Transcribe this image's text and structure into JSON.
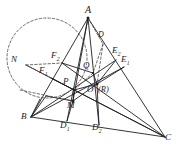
{
  "figure": {
    "type": "geometry-diagram",
    "width": 181,
    "height": 155,
    "background": "#ffffff",
    "stroke_color": "#1f1f1f",
    "dashed_color": "#4a4a4a"
  },
  "points": {
    "A": {
      "label": "A",
      "sub": "",
      "x": 88,
      "y": 18,
      "lx": 85,
      "ly": 7
    },
    "B": {
      "label": "B",
      "sub": "",
      "x": 31,
      "y": 117,
      "lx": 22,
      "ly": 113
    },
    "C": {
      "label": "C",
      "sub": "",
      "x": 165,
      "y": 137,
      "lx": 166,
      "ly": 134
    },
    "N": {
      "label": "N",
      "sub": "",
      "x": 26,
      "y": 65,
      "lx": 12,
      "ly": 56
    },
    "F2": {
      "label": "F",
      "sub": "2",
      "x": 62,
      "y": 63,
      "lx": 52,
      "ly": 52
    },
    "F1": {
      "label": "F",
      "sub": "1",
      "x": 51,
      "y": 78,
      "lx": 40,
      "ly": 67
    },
    "E2": {
      "label": "E",
      "sub": "2",
      "x": 116,
      "y": 60,
      "lx": 113,
      "ly": 47
    },
    "E1": {
      "label": "E",
      "sub": "1",
      "x": 124,
      "y": 67,
      "lx": 122,
      "ly": 56
    },
    "D3": {
      "label": "D",
      "sub": "",
      "x": 103,
      "y": 44,
      "lx": 99,
      "ly": 32
    },
    "Q": {
      "label": "Q",
      "sub": "",
      "x": 93,
      "y": 73,
      "lx": 84,
      "ly": 62
    },
    "P": {
      "label": "P",
      "sub": "",
      "x": 74,
      "y": 90,
      "lx": 64,
      "ly": 78
    },
    "O": {
      "label": "O",
      "sub": "",
      "x": 97,
      "y": 84,
      "lx": 88,
      "ly": 86
    },
    "R": {
      "label": "(R)",
      "sub": "",
      "x": 109,
      "y": 92,
      "lx": 100,
      "ly": 86
    },
    "M": {
      "label": "M",
      "sub": "",
      "x": 73,
      "y": 101,
      "lx": 68,
      "ly": 102
    },
    "D1": {
      "label": "D",
      "sub": "1",
      "x": 67,
      "y": 121,
      "lx": 61,
      "ly": 122
    },
    "D2": {
      "label": "D",
      "sub": "2",
      "x": 99,
      "y": 125,
      "lx": 93,
      "ly": 124
    }
  },
  "labels": [
    {
      "key": "A",
      "text": "A",
      "sub": "",
      "x": 85,
      "y": 7
    },
    {
      "key": "N",
      "text": "N",
      "sub": "",
      "x": 12,
      "y": 56
    },
    {
      "key": "F2",
      "text": "F",
      "sub": "2",
      "x": 52,
      "y": 52
    },
    {
      "key": "F1",
      "text": "F",
      "sub": "1",
      "x": 40,
      "y": 67
    },
    {
      "key": "D3",
      "text": "D",
      "sub": "",
      "x": 99,
      "y": 32
    },
    {
      "key": "E2",
      "text": "E",
      "sub": "2",
      "x": 113,
      "y": 47
    },
    {
      "key": "E1",
      "text": "E",
      "sub": "1",
      "x": 122,
      "y": 56
    },
    {
      "key": "Q",
      "text": "Q",
      "sub": "",
      "x": 84,
      "y": 62
    },
    {
      "key": "P",
      "text": "P",
      "sub": "",
      "x": 64,
      "y": 78
    },
    {
      "key": "O",
      "text": "O",
      "sub": "",
      "x": 88,
      "y": 86
    },
    {
      "key": "R",
      "text": "(R)",
      "sub": "",
      "x": 99,
      "y": 86
    },
    {
      "key": "M",
      "text": "M",
      "sub": "",
      "x": 68,
      "y": 102
    },
    {
      "key": "B",
      "text": "B",
      "sub": "",
      "x": 22,
      "y": 113
    },
    {
      "key": "D1",
      "text": "D",
      "sub": "1",
      "x": 61,
      "y": 122
    },
    {
      "key": "D2",
      "text": "D",
      "sub": "2",
      "x": 93,
      "y": 124
    },
    {
      "key": "C",
      "text": "C",
      "sub": "",
      "x": 166,
      "y": 134
    }
  ],
  "circle": {
    "name": "dashed-circle-N",
    "cx": 47,
    "cy": 58,
    "r": 40,
    "style": "dashed"
  }
}
